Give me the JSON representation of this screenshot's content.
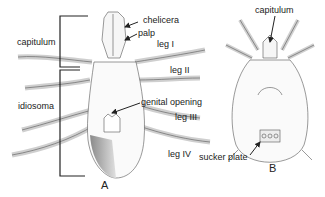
{
  "figure": {
    "panels": [
      {
        "id": "A",
        "label": "A"
      },
      {
        "id": "B",
        "label": "B"
      }
    ],
    "labels_a": {
      "chelicera": "chelicera",
      "palp": "palp",
      "capitulum": "capitulum",
      "leg1": "leg I",
      "leg2": "leg II",
      "idiosoma": "idiosoma",
      "genital_opening": "genital opening",
      "leg3": "leg III",
      "leg4": "leg IV"
    },
    "labels_b": {
      "capitulum": "capitulum",
      "sucker_plate": "sucker plate"
    },
    "colors": {
      "line": "#444444",
      "bracket": "#222222",
      "shade": "#9a9a9a",
      "text": "#222222"
    }
  }
}
